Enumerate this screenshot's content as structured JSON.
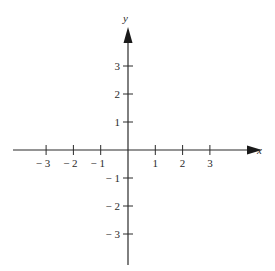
{
  "diagram": {
    "type": "cartesian-axes",
    "x_axis_label": "x",
    "y_axis_label": "y",
    "x_ticks": [
      {
        "value": -3,
        "label": "− 3"
      },
      {
        "value": -2,
        "label": "− 2"
      },
      {
        "value": -1,
        "label": "− 1"
      },
      {
        "value": 1,
        "label": "1"
      },
      {
        "value": 2,
        "label": "2"
      },
      {
        "value": 3,
        "label": "3"
      }
    ],
    "y_ticks": [
      {
        "value": 3,
        "label": "3"
      },
      {
        "value": 2,
        "label": "2"
      },
      {
        "value": 1,
        "label": "1"
      },
      {
        "value": -1,
        "label": "− 1"
      },
      {
        "value": -2,
        "label": "− 2"
      },
      {
        "value": -3,
        "label": "− 3"
      }
    ],
    "line_color": "#2a2a2a"
  }
}
